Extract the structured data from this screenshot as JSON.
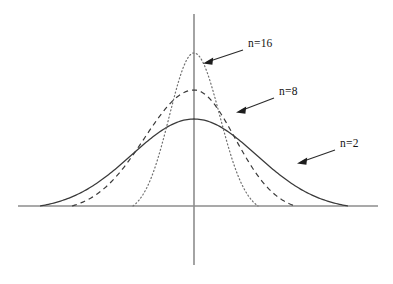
{
  "figure": {
    "title": "",
    "background_color": "#ffffff",
    "axis_color": "#8d8d8d",
    "curve_color": "#3a3a3a",
    "annotation_color": "#141414"
  },
  "annotations": [
    {
      "id": "n16",
      "label": "n=16",
      "label_x": 248,
      "label_y": 47,
      "leader_from_x": 243,
      "leader_from_y": 50,
      "leader_to_x": 203,
      "leader_to_y": 63,
      "target": "dotted-curve-peak"
    },
    {
      "id": "n8",
      "label": "n=8",
      "label_x": 279,
      "label_y": 95,
      "leader_from_x": 274,
      "leader_from_y": 98,
      "leader_to_x": 236,
      "leader_to_y": 112,
      "target": "dashed-curve-right-shoulder"
    },
    {
      "id": "n2",
      "label": "n=2",
      "label_x": 340,
      "label_y": 147,
      "leader_from_x": 335,
      "leader_from_y": 150,
      "leader_to_x": 297,
      "leader_to_y": 163,
      "target": "solid-curve-right-tail"
    }
  ],
  "axes": {
    "x_axis": {
      "x1": 18,
      "y1": 206,
      "x2": 378,
      "y2": 206
    },
    "y_axis": {
      "x1": 194,
      "y1": 14,
      "x2": 194,
      "y2": 265
    },
    "origin_x": 194,
    "baseline_y": 206,
    "grid": false,
    "tick_labels": []
  },
  "chart_data": {
    "type": "line",
    "title": "",
    "subtitle": "",
    "xlabel": "",
    "ylabel": "",
    "grid": false,
    "legend_position": "inline-annotations",
    "axis_ranges": {
      "xlim": [
        -4,
        4
      ],
      "ylim": [
        0,
        1
      ]
    },
    "series": [
      {
        "name": "n=2",
        "label": "n=2",
        "style": "solid",
        "peak_height": 0.42,
        "half_width": 4.0,
        "sigma": 1.55,
        "x": [
          -4.0,
          -3.5,
          -3.0,
          -2.5,
          -2.0,
          -1.5,
          -1.0,
          -0.5,
          0.0,
          0.5,
          1.0,
          1.5,
          2.0,
          2.5,
          3.0,
          3.5,
          4.0
        ],
        "y": [
          0.0,
          0.06,
          0.125,
          0.19,
          0.25,
          0.31,
          0.36,
          0.4,
          0.42,
          0.4,
          0.36,
          0.31,
          0.25,
          0.19,
          0.125,
          0.06,
          0.0
        ]
      },
      {
        "name": "n=8",
        "label": "n=8",
        "style": "dashed",
        "peak_height": 0.61,
        "half_width": 2.7,
        "sigma": 1.0,
        "x": [
          -2.7,
          -2.4,
          -2.0,
          -1.6,
          -1.2,
          -0.8,
          -0.4,
          0.0,
          0.4,
          0.8,
          1.2,
          1.6,
          2.0,
          2.4,
          2.7
        ],
        "y": [
          0.0,
          0.09,
          0.2,
          0.32,
          0.44,
          0.54,
          0.6,
          0.61,
          0.6,
          0.54,
          0.44,
          0.32,
          0.2,
          0.09,
          0.0
        ]
      },
      {
        "name": "n=16",
        "label": "n=16",
        "style": "dotted",
        "peak_height": 0.9,
        "half_width": 1.35,
        "sigma": 0.5,
        "x": [
          -1.35,
          -1.2,
          -1.0,
          -0.8,
          -0.6,
          -0.4,
          -0.2,
          0.0,
          0.2,
          0.4,
          0.6,
          0.8,
          1.0,
          1.2,
          1.35
        ],
        "y": [
          0.0,
          0.07,
          0.2,
          0.36,
          0.55,
          0.72,
          0.86,
          0.9,
          0.86,
          0.72,
          0.55,
          0.36,
          0.2,
          0.07,
          0.0
        ]
      }
    ],
    "pixel_geometry": {
      "n2": {
        "left_x": 40,
        "right_x": 348,
        "peak_x": 194,
        "peak_y": 119
      },
      "n8": {
        "left_x": 72,
        "right_x": 295,
        "peak_x": 194,
        "peak_y": 90
      },
      "n16": {
        "left_x": 133,
        "right_x": 258,
        "peak_x": 194,
        "peak_y": 53
      }
    }
  }
}
